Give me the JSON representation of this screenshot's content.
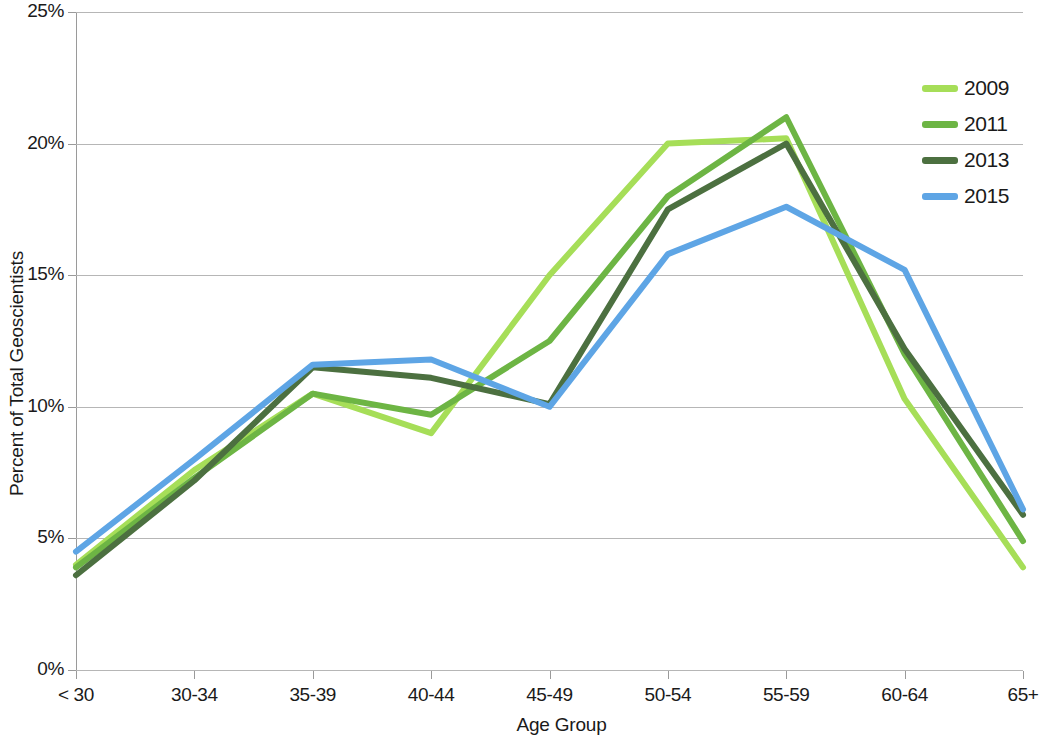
{
  "chart_data": {
    "type": "line",
    "title": "",
    "xlabel": "Age Group",
    "ylabel": "Percent of Total Geoscientists",
    "categories": [
      "< 30",
      "30-34",
      "35-39",
      "40-44",
      "45-49",
      "50-54",
      "55-59",
      "60-64",
      "65+"
    ],
    "ylim": [
      0,
      25
    ],
    "ytick_labels": [
      "0%",
      "5%",
      "10%",
      "15%",
      "20%",
      "25%"
    ],
    "ytick_values": [
      0,
      5,
      10,
      15,
      20,
      25
    ],
    "grid": "horizontal",
    "legend_position": "top-right",
    "series": [
      {
        "name": "2009",
        "color": "#a6de58",
        "values": [
          4.0,
          7.6,
          10.5,
          9.0,
          15.0,
          20.0,
          20.2,
          10.3,
          3.9
        ]
      },
      {
        "name": "2011",
        "color": "#6db544",
        "values": [
          3.9,
          7.3,
          10.5,
          9.7,
          12.5,
          18.0,
          21.0,
          12.0,
          4.9
        ]
      },
      {
        "name": "2013",
        "color": "#4c7040",
        "values": [
          3.6,
          7.2,
          11.5,
          11.1,
          10.1,
          17.5,
          20.0,
          12.2,
          5.9
        ]
      },
      {
        "name": "2015",
        "color": "#5ea5e5",
        "values": [
          4.5,
          8.0,
          11.6,
          11.8,
          10.0,
          15.8,
          17.6,
          15.2,
          6.1
        ]
      }
    ]
  },
  "legend": {
    "items": [
      {
        "label": "2009",
        "color": "#a6de58"
      },
      {
        "label": "2011",
        "color": "#6db544"
      },
      {
        "label": "2013",
        "color": "#4c7040"
      },
      {
        "label": "2015",
        "color": "#5ea5e5"
      }
    ]
  },
  "axes": {
    "y_title": "Percent of Total Geoscientists",
    "x_title": "Age Group"
  }
}
